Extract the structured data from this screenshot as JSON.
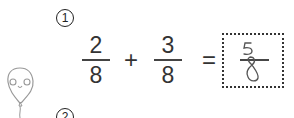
{
  "problems": [
    {
      "number": "1",
      "fraction_a": {
        "numerator": "2",
        "denominator": "8"
      },
      "operator": "+",
      "fraction_b": {
        "numerator": "3",
        "denominator": "8"
      },
      "equals": "=",
      "answer": {
        "numerator": "5",
        "denominator": "8",
        "style": "handwritten"
      }
    },
    {
      "number": "2"
    }
  ],
  "mascot": "balloon-face-icon",
  "colors": {
    "text": "#333333",
    "handwriting": "#444444",
    "box_border": "#333333"
  }
}
